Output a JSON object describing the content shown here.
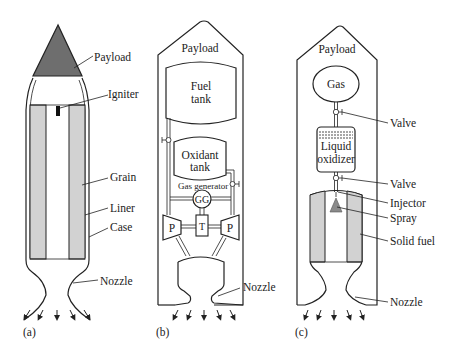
{
  "figure": {
    "panels": [
      {
        "id": "a",
        "caption": "(a)",
        "title": "Solid rocket motor",
        "labels": {
          "payload": "Payload",
          "igniter": "Igniter",
          "grain": "Grain",
          "liner": "Liner",
          "case": "Case",
          "nozzle": "Nozzle"
        }
      },
      {
        "id": "b",
        "caption": "(b)",
        "title": "Liquid rocket engine",
        "labels": {
          "payload": "Payload",
          "fuel_tank_line1": "Fuel",
          "fuel_tank_line2": "tank",
          "oxidant_tank_line1": "Oxidant",
          "oxidant_tank_line2": "tank",
          "gas_generator": "Gas generator",
          "gg": "GG",
          "pump_left": "P",
          "pump_right": "P",
          "turbine": "T",
          "nozzle": "Nozzle"
        }
      },
      {
        "id": "c",
        "caption": "(c)",
        "title": "Hybrid rocket motor",
        "labels": {
          "payload": "Payload",
          "gas": "Gas",
          "valve_top": "Valve",
          "liquid_oxidizer_line1": "Liquid",
          "liquid_oxidizer_line2": "oxidizer",
          "valve_bottom": "Valve",
          "injector": "Injector",
          "spray": "Spray",
          "solid_fuel": "Solid fuel",
          "nozzle": "Nozzle"
        }
      }
    ],
    "colors": {
      "stroke": "#222222",
      "payload_fill": "#6e6e6e",
      "grain_fill": "#d2d2d2",
      "spray_fill": "#8a8a8a",
      "background": "#ffffff"
    }
  }
}
